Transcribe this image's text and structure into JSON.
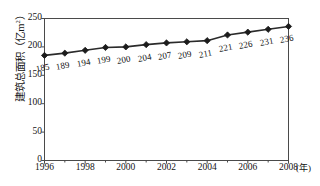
{
  "chart_data": {
    "type": "line",
    "title": "",
    "xlabel": "(年)",
    "ylabel": "建筑总面积（亿m",
    "ylabel_exponent": "2",
    "ylabel_tail": "）",
    "x": [
      1996,
      1997,
      1998,
      1999,
      2000,
      2001,
      2002,
      2003,
      2004,
      2005,
      2006,
      2007,
      2008
    ],
    "values": [
      185,
      189,
      194,
      199,
      200,
      204,
      207,
      209,
      211,
      221,
      226,
      231,
      236
    ],
    "point_labels": [
      "185",
      "189",
      "194",
      "199",
      "200",
      "204",
      "207",
      "209",
      "211",
      "221",
      "226",
      "231",
      "236"
    ],
    "categories": [
      "1996",
      "1997",
      "1998",
      "1999",
      "2000",
      "2001",
      "2002",
      "2003",
      "2004",
      "2005",
      "2006",
      "2007",
      "2008"
    ],
    "xtick_labels": [
      "1996",
      "1998",
      "2000",
      "2002",
      "2004",
      "2006",
      "2008"
    ],
    "xtick_values": [
      1996,
      1998,
      2000,
      2002,
      2004,
      2006,
      2008
    ],
    "xminor_values": [
      1997,
      1999,
      2001,
      2003,
      2005,
      2007
    ],
    "ytick_labels": [
      "0",
      "50",
      "100",
      "150",
      "200",
      "250"
    ],
    "ytick_values": [
      0,
      50,
      100,
      150,
      200,
      250
    ],
    "ylim": [
      0,
      250
    ],
    "xlim": [
      1996,
      2008
    ],
    "grid": false,
    "legend": false,
    "marker": "diamond",
    "line_color": "#2b2b2b",
    "marker_color": "#1c1c1c",
    "axis_color": "#4a4a4a",
    "background": "#ffffff"
  }
}
